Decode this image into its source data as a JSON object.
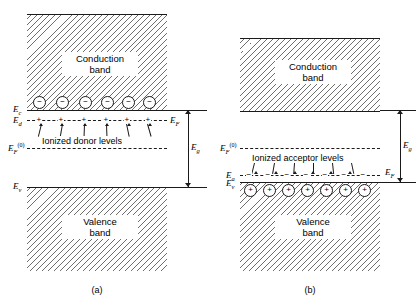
{
  "figure": {
    "panels": [
      {
        "id": "a",
        "caption": "(a)",
        "conduction_band_label_line1": "Conduction",
        "conduction_band_label_line2": "band",
        "valence_band_label_line1": "Valence",
        "valence_band_label_line2": "band",
        "levels_caption": "Ionized donor levels",
        "energy_labels": {
          "ec": "E",
          "ec_sub": "c",
          "ed": "E",
          "ed_sub": "d",
          "ef": "E",
          "ef_sub": "F",
          "ef0": "E",
          "ef0_sub": "F",
          "ef0_sup": "(0)",
          "ev": "E",
          "ev_sub": "v",
          "eg": "E",
          "eg_sub": "g"
        },
        "carrier_symbol": "−",
        "carrier_count": 6,
        "tick_symbol": "+",
        "tick_count": 6
      },
      {
        "id": "b",
        "caption": "(b)",
        "conduction_band_label_line1": "Conduction",
        "conduction_band_label_line2": "band",
        "valence_band_label_line1": "Valence",
        "valence_band_label_line2": "band",
        "levels_caption": "Ionized acceptor levels",
        "energy_labels": {
          "ea": "E",
          "ea_sub": "a",
          "ef": "E",
          "ef_sub": "F",
          "ef0": "E",
          "ef0_sub": "F",
          "ef0_sup": "(0)",
          "ev": "E",
          "ev_sub": "v",
          "eg": "E",
          "eg_sub": "g"
        },
        "carrier_symbol": "+",
        "carrier_count": 7,
        "tick_symbol": "−",
        "tick_count": 7
      }
    ]
  },
  "colors": {
    "line": "#1a1a1a",
    "hatch": "#6e6e6e",
    "background": "#ffffff"
  }
}
